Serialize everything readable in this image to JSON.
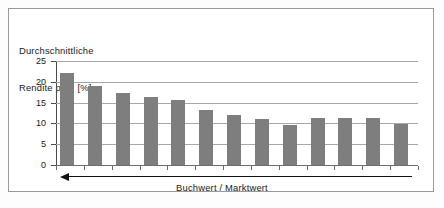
{
  "chart_data": {
    "type": "bar",
    "title": "Durchschnittliche Rendite p.a. [%]",
    "title_line1": "Durchschnittliche",
    "title_line2": "Rendite p.a.  [%]",
    "xlabel": "Buchwert / Marktwert",
    "ylabel": "Durchschnittliche Rendite p.a. [%]",
    "categories": [
      "1",
      "2",
      "3",
      "4",
      "5",
      "6",
      "7",
      "8",
      "9",
      "10",
      "11",
      "12",
      "13"
    ],
    "values": [
      22.0,
      19.0,
      17.3,
      16.4,
      15.6,
      13.2,
      12.0,
      11.0,
      9.7,
      11.2,
      11.2,
      11.2,
      9.9
    ],
    "ylim": [
      0,
      25
    ],
    "yticks": [
      0,
      5,
      10,
      15,
      20,
      25
    ],
    "ytick_labels": [
      "0",
      "5",
      "10",
      "15",
      "20",
      "25"
    ],
    "grid": true,
    "legend": false,
    "bar_color": "#7e7e7e",
    "grid_color": "#a8a8a8",
    "axis_color": "#4a4a4a",
    "annotation": {
      "name": "decreasing-direction-arrow",
      "direction": "left",
      "label": "Buchwert / Marktwert"
    }
  }
}
